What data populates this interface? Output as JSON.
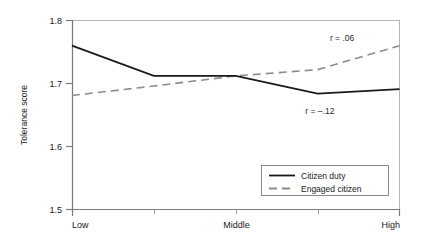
{
  "chart_data": {
    "type": "line",
    "title": "",
    "xlabel": "",
    "ylabel": "Tolerance score",
    "categories": [
      "Low",
      "",
      "Middle",
      "",
      "High"
    ],
    "x": [
      1,
      2,
      3,
      4,
      5
    ],
    "xtick_labels": [
      "Low",
      "Middle",
      "High"
    ],
    "xtick_positions": [
      1,
      3,
      5
    ],
    "ylim": [
      1.5,
      1.8
    ],
    "ytick_labels": [
      "1.5",
      "1.6",
      "1.7",
      "1.8"
    ],
    "ytick_values": [
      1.5,
      1.6,
      1.7,
      1.8
    ],
    "grid": false,
    "legend_position": "bottom-right",
    "series": [
      {
        "name": "Citizen duty",
        "style": "solid",
        "color": "#1a1a1a",
        "values": [
          1.76,
          1.712,
          1.712,
          1.684,
          1.691
        ]
      },
      {
        "name": "Engaged citizen",
        "style": "dashed",
        "color": "#8c8c8c",
        "values": [
          1.681,
          1.696,
          1.712,
          1.722,
          1.76
        ]
      }
    ],
    "annotations": [
      {
        "text": "r = .06",
        "x": 4.15,
        "y": 1.772,
        "series": "Engaged citizen"
      },
      {
        "text": "r = –.12",
        "x": 3.85,
        "y": 1.657,
        "series": "Citizen duty"
      }
    ]
  },
  "axes": {
    "y_title": "Tolerance score",
    "y_ticks": [
      "1.8",
      "1.7",
      "1.6",
      "1.5"
    ],
    "x_ticks": [
      "Low",
      "Middle",
      "High"
    ]
  },
  "legend": {
    "entries": [
      {
        "label": "Citizen duty",
        "style": "solid"
      },
      {
        "label": "Engaged citizen",
        "style": "dashed"
      }
    ]
  },
  "annotations": {
    "engaged_r": "r = .06",
    "duty_r": "r = –.12"
  },
  "colors": {
    "solid_series": "#1a1a1a",
    "dashed_series": "#8c8c8c",
    "axis": "#7a7a7a",
    "frame": "#9a9a9a",
    "background": "#ffffff"
  }
}
